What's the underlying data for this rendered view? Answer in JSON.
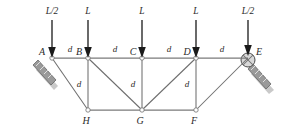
{
  "figure": {
    "type": "truss-diagram",
    "title": ""
  },
  "loads": [
    {
      "label": "L/2",
      "at_joint": "A",
      "x": 52,
      "label_x": 52,
      "direction": "down"
    },
    {
      "label": "L",
      "at_joint": "B",
      "x": 88,
      "label_x": 88,
      "direction": "down"
    },
    {
      "label": "L",
      "at_joint": "C",
      "x": 142,
      "label_x": 142,
      "direction": "down"
    },
    {
      "label": "L",
      "at_joint": "D",
      "x": 196,
      "label_x": 196,
      "direction": "down"
    },
    {
      "label": "L/2",
      "at_joint": "E",
      "x": 248,
      "label_x": 248,
      "direction": "down"
    }
  ],
  "joints": [
    {
      "name": "A",
      "x": 52,
      "y": 58,
      "label_dx": -10,
      "label_dy": -4,
      "support": "pin-inclined"
    },
    {
      "name": "B",
      "x": 88,
      "y": 58,
      "label_dx": -10,
      "label_dy": -4,
      "support": "none"
    },
    {
      "name": "C",
      "x": 142,
      "y": 58,
      "label_dx": -10,
      "label_dy": -4,
      "support": "none"
    },
    {
      "name": "D",
      "x": 196,
      "y": 58,
      "label_dx": -10,
      "label_dy": -4,
      "support": "none"
    },
    {
      "name": "E",
      "x": 248,
      "y": 58,
      "label_dx": 6,
      "label_dy": -4,
      "support": "roller-inclined"
    },
    {
      "name": "H",
      "x": 88,
      "y": 110,
      "label_dx": -3,
      "label_dy": 13,
      "support": "none"
    },
    {
      "name": "G",
      "x": 142,
      "y": 110,
      "label_dx": -3,
      "label_dy": 13,
      "support": "none"
    },
    {
      "name": "F",
      "x": 196,
      "y": 110,
      "label_dx": -3,
      "label_dy": 13,
      "support": "none"
    }
  ],
  "members": [
    {
      "from": "A",
      "to": "B",
      "kind": "top-chord"
    },
    {
      "from": "B",
      "to": "C",
      "kind": "top-chord"
    },
    {
      "from": "C",
      "to": "D",
      "kind": "top-chord"
    },
    {
      "from": "D",
      "to": "E",
      "kind": "top-chord"
    },
    {
      "from": "H",
      "to": "G",
      "kind": "bottom-chord"
    },
    {
      "from": "G",
      "to": "F",
      "kind": "bottom-chord"
    },
    {
      "from": "B",
      "to": "H",
      "kind": "vertical"
    },
    {
      "from": "C",
      "to": "G",
      "kind": "vertical"
    },
    {
      "from": "D",
      "to": "F",
      "kind": "vertical"
    },
    {
      "from": "A",
      "to": "H",
      "kind": "diagonal"
    },
    {
      "from": "B",
      "to": "G",
      "kind": "diagonal"
    },
    {
      "from": "G",
      "to": "D",
      "kind": "diagonal"
    },
    {
      "from": "F",
      "to": "E",
      "kind": "diagonal"
    }
  ],
  "dimensions": [
    {
      "label": "d",
      "x": 70,
      "y": 52,
      "span": "A-B",
      "orientation": "horizontal"
    },
    {
      "label": "d",
      "x": 115,
      "y": 52,
      "span": "B-C",
      "orientation": "horizontal"
    },
    {
      "label": "d",
      "x": 169,
      "y": 52,
      "span": "C-D",
      "orientation": "horizontal"
    },
    {
      "label": "d",
      "x": 222,
      "y": 52,
      "span": "D-E",
      "orientation": "horizontal"
    },
    {
      "label": "d",
      "x": 79,
      "y": 87,
      "span": "B-H",
      "orientation": "vertical"
    },
    {
      "label": "d",
      "x": 133,
      "y": 87,
      "span": "C-G",
      "orientation": "vertical"
    },
    {
      "label": "d",
      "x": 187,
      "y": 87,
      "span": "D-F",
      "orientation": "vertical"
    }
  ],
  "supports": {
    "left": {
      "joint": "A",
      "type": "pin-on-incline",
      "name": "support-a"
    },
    "right": {
      "joint": "E",
      "type": "roller-on-incline",
      "name": "support-e"
    }
  },
  "colors": {
    "member": "#6e6e6e",
    "chord": "#7a7a7a",
    "arrow": "#1a1a1a",
    "label": "#2b2b2b",
    "support_plate": "#9a9a9a",
    "support_shadow": "#c9c9c9",
    "background": "#ffffff"
  }
}
